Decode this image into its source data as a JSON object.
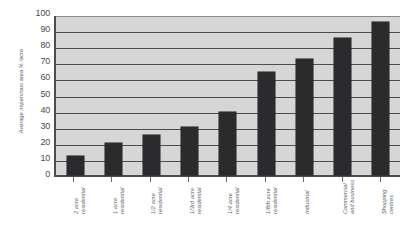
{
  "chart_data": {
    "type": "bar",
    "title": "",
    "xlabel": "",
    "ylabel": "Average impervious area  % /acre",
    "ylim": [
      0,
      100
    ],
    "ytick_labels": [
      "100",
      "90",
      "80",
      "70",
      "60",
      "50",
      "40",
      "30",
      "20",
      "10",
      "0"
    ],
    "ytick_values": [
      100,
      90,
      80,
      70,
      60,
      50,
      40,
      30,
      20,
      10,
      0
    ],
    "grid": true,
    "legend": false,
    "categories": [
      "2 acre residential",
      "1 acre residential",
      "1/2 acre residential",
      "1/3rd acre residential",
      "1/4 acre residential",
      "1/8th acre residential",
      "Industrial",
      "Commercial and business",
      "Shopping centres"
    ],
    "category_lines": [
      [
        "2 acre",
        "residential"
      ],
      [
        "1 acre",
        "residential"
      ],
      [
        "1/2 acre",
        "residential"
      ],
      [
        "1/3rd acre",
        "residential"
      ],
      [
        "1/4 acre",
        "residential"
      ],
      [
        "1/8th acre",
        "residential"
      ],
      [
        "Industrial",
        ""
      ],
      [
        "Commercial",
        "and business"
      ],
      [
        "Shopping",
        "centres"
      ]
    ],
    "values": [
      12,
      20,
      25,
      30,
      39,
      64,
      72,
      85,
      95
    ],
    "bar_color": "#2b2b2d",
    "plot_background": "#d6d6d6",
    "axis_color": "#4d4d4f"
  }
}
